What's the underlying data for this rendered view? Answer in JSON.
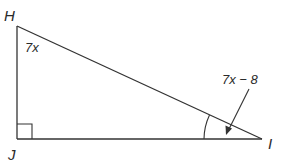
{
  "diagram": {
    "type": "right-triangle",
    "vertices": [
      {
        "id": "H",
        "label": "H",
        "x": 17,
        "y": 26
      },
      {
        "id": "J",
        "label": "J",
        "x": 17,
        "y": 139
      },
      {
        "id": "I",
        "label": "I",
        "x": 262,
        "y": 139
      }
    ],
    "right_angle_at": "J",
    "angles": {
      "H": {
        "label": "7x"
      },
      "I": {
        "label": "7x − 8",
        "marked_with_arc": true,
        "arrow_pointer": true
      }
    },
    "colors": {
      "stroke": "#333333",
      "text": "#2a2a2a",
      "background": "#ffffff"
    }
  }
}
